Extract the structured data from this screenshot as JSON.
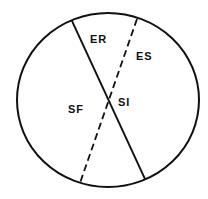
{
  "diagram": {
    "type": "circle-quadrant-diagram",
    "circle": {
      "cx": 108,
      "cy": 100,
      "rx": 91,
      "ry": 87,
      "stroke": "#111111"
    },
    "lines": [
      {
        "name": "solid-axis",
        "style": "solid",
        "x1": 72,
        "y1": 21,
        "x2": 145,
        "y2": 179
      },
      {
        "name": "dashed-axis",
        "style": "dashed",
        "x1": 137,
        "y1": 19,
        "x2": 80,
        "y2": 183
      }
    ],
    "labels": {
      "er": {
        "text": "ER",
        "x": 90,
        "y": 43
      },
      "es": {
        "text": "ES",
        "x": 136,
        "y": 60
      },
      "sf": {
        "text": "SF",
        "x": 68,
        "y": 113
      },
      "si": {
        "text": "SI",
        "x": 118,
        "y": 106
      }
    }
  }
}
